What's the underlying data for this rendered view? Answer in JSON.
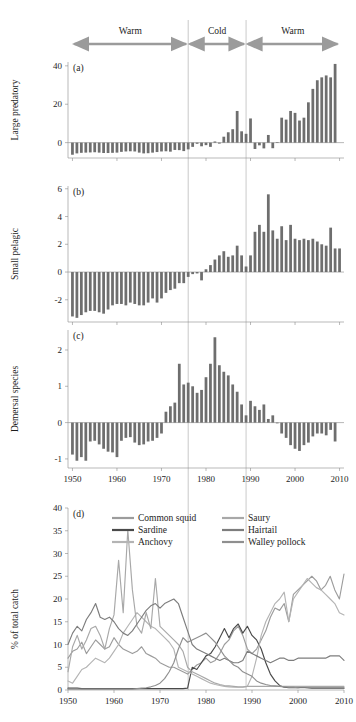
{
  "figure": {
    "title": "",
    "regimes": [
      {
        "label": "Warm",
        "start": 1950,
        "end": 1976
      },
      {
        "label": "Cold",
        "start": 1976,
        "end": 1989
      },
      {
        "label": "Warm",
        "start": 1989,
        "end": 2010
      }
    ],
    "regime_boundaries": [
      1976,
      1989
    ],
    "colors": {
      "bar": "#6e6e6e",
      "axis": "#8a8a8a",
      "divider": "#b2b2b2",
      "arrow": "#9b9b9b",
      "text": "#1d1d1d"
    }
  },
  "chart_data": [
    {
      "type": "bar",
      "panel": "a",
      "title": "",
      "xlabel": "",
      "ylabel": "Large predatory",
      "ylim": [
        -8,
        42
      ],
      "yticks": [
        0,
        20,
        40
      ],
      "ytick_labels": [
        "0",
        "20",
        "40"
      ],
      "xlim": [
        1949,
        2011
      ],
      "xticks": [
        1950,
        1960,
        1970,
        1980,
        1990,
        2000,
        2010
      ],
      "xtick_labels": [
        "1950",
        "1960",
        "1970",
        "1980",
        "1990",
        "2000",
        "2010"
      ],
      "grid": false,
      "x": [
        1950,
        1951,
        1952,
        1953,
        1954,
        1955,
        1956,
        1957,
        1958,
        1959,
        1960,
        1961,
        1962,
        1963,
        1964,
        1965,
        1966,
        1967,
        1968,
        1969,
        1970,
        1971,
        1972,
        1973,
        1974,
        1975,
        1976,
        1977,
        1978,
        1979,
        1980,
        1981,
        1982,
        1983,
        1984,
        1985,
        1986,
        1987,
        1988,
        1989,
        1990,
        1991,
        1992,
        1993,
        1994,
        1995,
        1996,
        1997,
        1998,
        1999,
        2000,
        2001,
        2002,
        2003,
        2004,
        2005,
        2006,
        2007,
        2008,
        2009,
        2010
      ],
      "values": [
        -6.3,
        -5.6,
        -5.3,
        -5.2,
        -5.1,
        -5.0,
        -5.2,
        -5.4,
        -5.4,
        -5.3,
        -5.2,
        -4.8,
        -4.6,
        -4.5,
        -4.6,
        -5.2,
        -5.6,
        -5.5,
        -5.2,
        -4.9,
        -4.6,
        -4.5,
        -4.7,
        -3.8,
        -3.9,
        -4.4,
        -3.5,
        -2.2,
        -0.6,
        -1.9,
        -1.3,
        -2.2,
        0.6,
        -0.5,
        3.1,
        5.4,
        7.0,
        16.5,
        5.9,
        4.6,
        12.6,
        -3.3,
        -1.4,
        -3.0,
        4.0,
        -2.9,
        0.3,
        13.0,
        12.0,
        16.5,
        15.5,
        11.5,
        13.0,
        21.0,
        28.0,
        32.5,
        34.0,
        35.0,
        34.0,
        41.0,
        0.0
      ]
    },
    {
      "type": "bar",
      "panel": "b",
      "title": "",
      "xlabel": "",
      "ylabel": "Small pelagic",
      "ylim": [
        -3.6,
        6.2
      ],
      "yticks": [
        -2,
        0,
        2,
        4,
        6
      ],
      "ytick_labels": [
        "-2",
        "0",
        "2",
        "4",
        "6"
      ],
      "xlim": [
        1949,
        2011
      ],
      "xticks": [
        1950,
        1960,
        1970,
        1980,
        1990,
        2000,
        2010
      ],
      "xtick_labels": [
        "1950",
        "1960",
        "1970",
        "1980",
        "1990",
        "2000",
        "2010"
      ],
      "grid": false,
      "x": [
        1950,
        1951,
        1952,
        1953,
        1954,
        1955,
        1956,
        1957,
        1958,
        1959,
        1960,
        1961,
        1962,
        1963,
        1964,
        1965,
        1966,
        1967,
        1968,
        1969,
        1970,
        1971,
        1972,
        1973,
        1974,
        1975,
        1976,
        1977,
        1978,
        1979,
        1980,
        1981,
        1982,
        1983,
        1984,
        1985,
        1986,
        1987,
        1988,
        1989,
        1990,
        1991,
        1992,
        1993,
        1994,
        1995,
        1996,
        1997,
        1998,
        1999,
        2000,
        2001,
        2002,
        2003,
        2004,
        2005,
        2006,
        2007,
        2008,
        2009,
        2010
      ],
      "values": [
        -3.2,
        -3.3,
        -3.1,
        -2.9,
        -2.8,
        -2.8,
        -2.9,
        -3.0,
        -2.7,
        -2.4,
        -2.3,
        -2.3,
        -2.4,
        -2.2,
        -2.3,
        -2.4,
        -2.4,
        -2.2,
        -1.9,
        -2.2,
        -1.9,
        -1.5,
        -1.3,
        -1.2,
        -0.8,
        -0.8,
        -0.35,
        -0.15,
        -0.1,
        -0.6,
        0.2,
        0.5,
        0.9,
        1.2,
        1.5,
        1.1,
        1.2,
        1.9,
        1.2,
        0.4,
        1.2,
        2.9,
        3.4,
        2.9,
        5.6,
        3.0,
        2.4,
        3.3,
        2.3,
        3.4,
        2.4,
        2.3,
        2.4,
        2.3,
        2.4,
        2.2,
        2.0,
        1.9,
        3.2,
        1.7,
        1.7
      ]
    },
    {
      "type": "bar",
      "panel": "c",
      "title": "",
      "xlabel": "",
      "ylabel": "Demersal species",
      "ylim": [
        -1.25,
        2.55
      ],
      "yticks": [
        -1,
        0,
        1,
        2
      ],
      "ytick_labels": [
        "-1",
        "0",
        "1",
        "2"
      ],
      "xlim": [
        1949,
        2011
      ],
      "xticks": [
        1950,
        1960,
        1970,
        1980,
        1990,
        2000,
        2010
      ],
      "xtick_labels": [
        "1950",
        "1960",
        "1970",
        "1980",
        "1990",
        "2000",
        "2010"
      ],
      "grid": false,
      "x": [
        1950,
        1951,
        1952,
        1953,
        1954,
        1955,
        1956,
        1957,
        1958,
        1959,
        1960,
        1961,
        1962,
        1963,
        1964,
        1965,
        1966,
        1967,
        1968,
        1969,
        1970,
        1971,
        1972,
        1973,
        1974,
        1975,
        1976,
        1977,
        1978,
        1979,
        1980,
        1981,
        1982,
        1983,
        1984,
        1985,
        1986,
        1987,
        1988,
        1989,
        1990,
        1991,
        1992,
        1993,
        1994,
        1995,
        1996,
        1997,
        1998,
        1999,
        2000,
        2001,
        2002,
        2003,
        2004,
        2005,
        2006,
        2007,
        2008,
        2009,
        2010
      ],
      "values": [
        -0.88,
        -1.05,
        -0.95,
        -1.05,
        -0.52,
        -0.5,
        -0.6,
        -0.72,
        -0.8,
        -0.82,
        -0.95,
        -0.5,
        -0.42,
        -0.4,
        -0.55,
        -0.62,
        -0.6,
        -0.52,
        -0.5,
        -0.42,
        -0.3,
        0.3,
        0.45,
        0.55,
        1.62,
        1.05,
        1.1,
        1.0,
        0.82,
        0.9,
        1.25,
        1.62,
        2.35,
        1.58,
        1.4,
        1.3,
        1.05,
        0.85,
        0.5,
        0.2,
        0.6,
        0.45,
        0.35,
        0.5,
        0.1,
        0.2,
        -0.02,
        -0.3,
        -0.42,
        -0.62,
        -0.72,
        -0.78,
        -0.62,
        -0.55,
        -0.38,
        -0.3,
        -0.3,
        -0.35,
        -0.2,
        -0.52,
        0.0
      ]
    },
    {
      "type": "line",
      "panel": "d",
      "title": "",
      "xlabel": "",
      "ylabel": "% of total catch",
      "ylim": [
        0,
        40
      ],
      "yticks": [
        0,
        5,
        10,
        15,
        20,
        25,
        30,
        35,
        40
      ],
      "ytick_labels": [
        "0",
        "5",
        "10",
        "15",
        "20",
        "25",
        "30",
        "35",
        "40"
      ],
      "xlim": [
        1950,
        2010
      ],
      "xticks": [
        1950,
        1960,
        1970,
        1980,
        1990,
        2000,
        2010
      ],
      "xtick_labels": [
        "1950",
        "1960",
        "1970",
        "1980",
        "1990",
        "2000",
        "2010"
      ],
      "grid": false,
      "legend_position": "top",
      "x": [
        1950,
        1951,
        1952,
        1953,
        1954,
        1955,
        1956,
        1957,
        1958,
        1959,
        1960,
        1961,
        1962,
        1963,
        1964,
        1965,
        1966,
        1967,
        1968,
        1969,
        1970,
        1971,
        1972,
        1973,
        1974,
        1975,
        1976,
        1977,
        1978,
        1979,
        1980,
        1981,
        1982,
        1983,
        1984,
        1985,
        1986,
        1987,
        1988,
        1989,
        1990,
        1991,
        1992,
        1993,
        1994,
        1995,
        1996,
        1997,
        1998,
        1999,
        2000,
        2001,
        2002,
        2003,
        2004,
        2005,
        2006,
        2007,
        2008,
        2009,
        2010
      ],
      "series": [
        {
          "name": "Common squid",
          "color": "#9c9c9c",
          "values": [
            7.0,
            8.5,
            9.0,
            10.5,
            8.0,
            9.5,
            11.0,
            10.0,
            9.0,
            9.5,
            11.5,
            10.0,
            9.0,
            8.5,
            8.0,
            8.5,
            9.5,
            8.0,
            7.5,
            7.0,
            6.0,
            5.5,
            5.0,
            5.0,
            4.5,
            4.0,
            3.5,
            4.5,
            5.5,
            6.0,
            7.0,
            6.0,
            6.5,
            8.0,
            10.0,
            11.0,
            13.0,
            14.0,
            12.0,
            9.0,
            8.0,
            9.0,
            11.0,
            13.0,
            16.0,
            18.0,
            17.5,
            19.0,
            15.0,
            21.0,
            22.0,
            23.0,
            24.0,
            25.0,
            24.0,
            22.0,
            23.0,
            25.0,
            22.0,
            20.0,
            25.5
          ]
        },
        {
          "name": "Sardine",
          "color": "#4a4a4a",
          "values": [
            0.4,
            0.4,
            0.4,
            0.3,
            0.3,
            0.3,
            0.3,
            0.3,
            0.3,
            0.3,
            0.3,
            0.3,
            0.3,
            0.3,
            0.3,
            0.3,
            0.3,
            0.3,
            0.3,
            0.3,
            0.3,
            0.3,
            0.3,
            0.3,
            0.3,
            0.3,
            0.4,
            5.0,
            4.5,
            6.0,
            7.5,
            8.0,
            9.5,
            11.5,
            13.5,
            11.5,
            13.5,
            14.5,
            12.5,
            14.0,
            12.0,
            11.0,
            9.0,
            6.0,
            3.5,
            2.0,
            1.0,
            0.6,
            0.5,
            0.5,
            0.5,
            0.6,
            0.5,
            0.4,
            0.4,
            0.4,
            0.4,
            0.4,
            0.4,
            0.4,
            0.4
          ]
        },
        {
          "name": "Anchovy",
          "color": "#b4b4b4",
          "values": [
            2.0,
            1.5,
            3.0,
            4.5,
            5.0,
            6.0,
            7.0,
            6.5,
            6.0,
            7.0,
            8.5,
            10.0,
            12.5,
            14.0,
            15.5,
            17.0,
            16.0,
            15.0,
            14.0,
            13.5,
            12.5,
            11.5,
            10.5,
            9.0,
            5.0,
            4.5,
            4.0,
            3.5,
            3.0,
            2.5,
            2.0,
            1.5,
            1.2,
            1.0,
            0.8,
            0.7,
            0.6,
            0.6,
            0.6,
            0.8,
            3.0,
            7.0,
            12.0,
            15.0,
            17.0,
            19.0,
            20.0,
            21.5,
            15.0,
            20.0,
            21.5,
            23.0,
            24.5,
            23.5,
            22.5,
            22.0,
            21.0,
            20.0,
            19.0,
            17.0,
            16.5
          ]
        },
        {
          "name": "Saury",
          "color": "#a8a8a8",
          "values": [
            4.0,
            9.5,
            12.0,
            9.0,
            11.0,
            13.5,
            14.0,
            12.0,
            9.0,
            13.5,
            16.5,
            28.5,
            17.0,
            35.2,
            22.0,
            14.0,
            12.5,
            17.0,
            13.5,
            24.5,
            14.0,
            13.0,
            12.0,
            11.0,
            10.0,
            8.5,
            5.0,
            4.0,
            3.5,
            3.0,
            2.5,
            2.0,
            1.5,
            1.2,
            1.0,
            0.9,
            0.8,
            0.7,
            0.7,
            0.8,
            0.8,
            0.8,
            0.8,
            0.8,
            0.8,
            0.8,
            0.8,
            0.8,
            0.8,
            0.8,
            0.8,
            0.8,
            0.8,
            0.8,
            0.8,
            0.8,
            0.8,
            0.8,
            0.8,
            0.8,
            0.8
          ]
        },
        {
          "name": "Hairtail",
          "color": "#7d7d7d",
          "values": [
            10.0,
            12.5,
            14.0,
            13.0,
            15.5,
            17.0,
            19.0,
            16.0,
            15.5,
            16.0,
            15.0,
            13.5,
            12.5,
            12.0,
            13.0,
            14.5,
            16.0,
            17.5,
            18.5,
            19.0,
            18.0,
            19.0,
            19.5,
            20.0,
            19.0,
            16.0,
            13.0,
            10.0,
            9.0,
            8.5,
            8.0,
            7.5,
            7.0,
            6.5,
            7.0,
            6.5,
            6.0,
            6.0,
            6.5,
            8.5,
            8.0,
            7.5,
            7.0,
            6.5,
            6.0,
            6.5,
            7.0,
            7.0,
            6.5,
            6.5,
            7.0,
            7.0,
            7.0,
            7.0,
            7.0,
            7.0,
            7.0,
            7.5,
            7.5,
            7.5,
            6.5
          ]
        },
        {
          "name": "Walley pollock",
          "color": "#8f8f8f",
          "values": [
            0.2,
            0.2,
            0.2,
            0.2,
            0.2,
            0.2,
            0.2,
            0.2,
            0.2,
            0.2,
            0.2,
            0.2,
            0.2,
            0.2,
            0.2,
            0.3,
            0.4,
            0.5,
            0.7,
            1.0,
            1.5,
            2.5,
            4.0,
            6.0,
            9.0,
            11.5,
            10.5,
            11.0,
            11.5,
            12.0,
            12.5,
            11.5,
            10.5,
            9.0,
            7.5,
            6.5,
            5.5,
            5.0,
            4.0,
            3.5,
            3.0,
            2.0,
            1.5,
            1.2,
            1.0,
            0.9,
            0.8,
            0.7,
            0.6,
            0.6,
            0.5,
            0.5,
            0.5,
            0.5,
            0.5,
            0.5,
            0.5,
            0.5,
            0.5,
            0.5,
            0.5
          ]
        }
      ],
      "legend": [
        {
          "name": "Common squid",
          "color": "#9c9c9c"
        },
        {
          "name": "Sardine",
          "color": "#4a4a4a"
        },
        {
          "name": "Anchovy",
          "color": "#b4b4b4"
        },
        {
          "name": "Saury",
          "color": "#a8a8a8"
        },
        {
          "name": "Hairtail",
          "color": "#7d7d7d"
        },
        {
          "name": "Walley pollock",
          "color": "#8f8f8f"
        }
      ]
    }
  ]
}
